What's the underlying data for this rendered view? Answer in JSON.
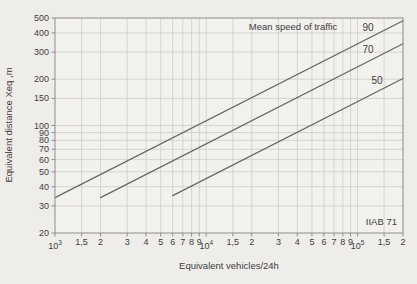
{
  "chart_data": {
    "type": "line",
    "title": "",
    "xlabel": "Equivalent vehicles/24h",
    "ylabel": "Equivalent distance Xeq ,m",
    "legend_title": "Mean speed of traffic",
    "source_label": "IIAB 71",
    "x_scale": "log",
    "y_scale": "log",
    "xlim": [
      1000,
      200000
    ],
    "ylim": [
      20,
      500
    ],
    "grid": true,
    "x_ticks": [
      {
        "v": 1000,
        "base": "10",
        "exp": "3"
      },
      {
        "v": 1500,
        "t": "1,5"
      },
      {
        "v": 2000,
        "t": "2"
      },
      {
        "v": 3000,
        "t": "3"
      },
      {
        "v": 4000,
        "t": "4"
      },
      {
        "v": 5000,
        "t": "5"
      },
      {
        "v": 6000,
        "t": "6"
      },
      {
        "v": 7000,
        "t": "7"
      },
      {
        "v": 8000,
        "t": "8"
      },
      {
        "v": 9000,
        "t": "9"
      },
      {
        "v": 10000,
        "base": "10",
        "exp": "4"
      },
      {
        "v": 15000,
        "t": "1,5"
      },
      {
        "v": 20000,
        "t": "2"
      },
      {
        "v": 30000,
        "t": "3"
      },
      {
        "v": 40000,
        "t": "4"
      },
      {
        "v": 50000,
        "t": "5"
      },
      {
        "v": 60000,
        "t": "6"
      },
      {
        "v": 70000,
        "t": "7"
      },
      {
        "v": 80000,
        "t": "8"
      },
      {
        "v": 90000,
        "t": "9"
      },
      {
        "v": 100000,
        "base": "10",
        "exp": "5"
      },
      {
        "v": 150000,
        "t": "1,5"
      },
      {
        "v": 200000,
        "t": "2"
      }
    ],
    "y_ticks": [
      500,
      400,
      300,
      200,
      150,
      100,
      90,
      80,
      70,
      60,
      50,
      40,
      30,
      20
    ],
    "series": [
      {
        "name": "90",
        "points": [
          [
            1000,
            34
          ],
          [
            200000,
            480
          ]
        ]
      },
      {
        "name": "70",
        "points": [
          [
            2000,
            34
          ],
          [
            200000,
            340
          ]
        ]
      },
      {
        "name": "50",
        "points": [
          [
            6000,
            35
          ],
          [
            200000,
            202
          ]
        ]
      }
    ],
    "colors": {
      "line": "#676767",
      "grid": "#cfcdc9",
      "frame": "#8e8d8a",
      "text": "#3e3e3c",
      "plot_bg": "#f2f1ee"
    }
  }
}
